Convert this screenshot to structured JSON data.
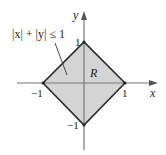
{
  "diagram": {
    "type": "region-plot",
    "region_label": "R",
    "inequality_label": "|x| + |y| ≤ 1",
    "axes": {
      "x_label": "x",
      "y_label": "y"
    },
    "ticks": {
      "x_pos": "1",
      "x_neg": "−1",
      "y_pos": "1",
      "y_neg": "−1"
    },
    "vertices": [
      [
        1,
        0
      ],
      [
        0,
        1
      ],
      [
        -1,
        0
      ],
      [
        0,
        -1
      ]
    ],
    "colors": {
      "fill": "#d4d4d4",
      "edge": "#2a2a2a",
      "axis": "#777777"
    }
  }
}
